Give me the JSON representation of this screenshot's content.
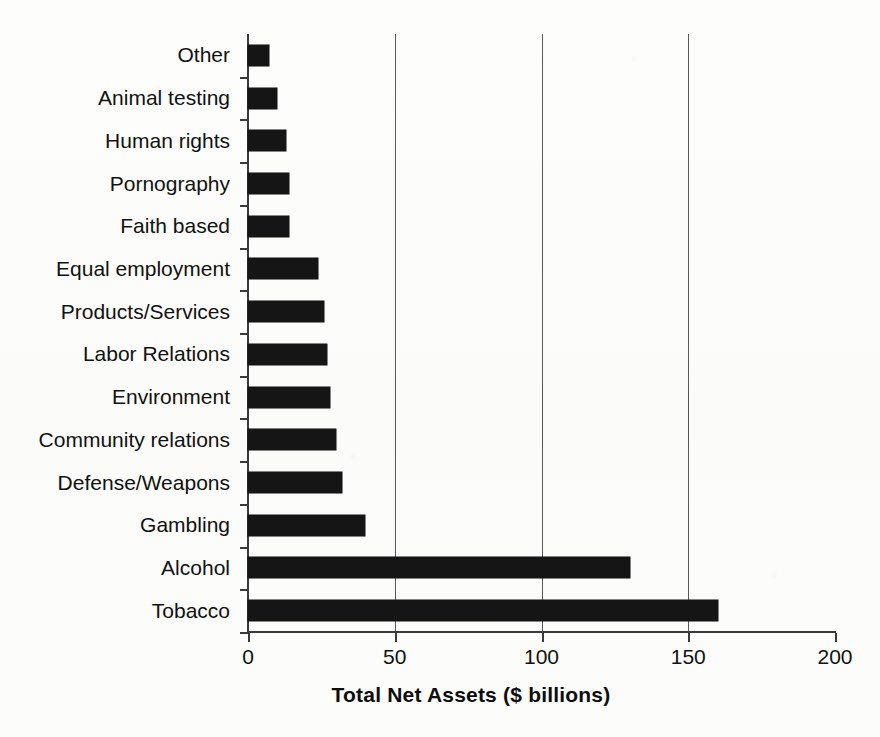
{
  "chart_data": {
    "type": "bar",
    "orientation": "horizontal",
    "title": "",
    "xlabel": "Total Net Assets ($ billions)",
    "ylabel": "",
    "xlim": [
      0,
      200
    ],
    "xticks": [
      0,
      50,
      100,
      150,
      200
    ],
    "xtick_labels": [
      "0",
      "50",
      "100",
      "150",
      "200"
    ],
    "grid": "vertical",
    "legend": "none",
    "categories": [
      "Other",
      "Animal testing",
      "Human rights",
      "Pornography",
      "Faith based",
      "Equal employment",
      "Products/Services",
      "Labor Relations",
      "Environment",
      "Community relations",
      "Defense/Weapons",
      "Gambling",
      "Alcohol",
      "Tobacco"
    ],
    "values": [
      7,
      10,
      13,
      14,
      14,
      24,
      26,
      27,
      28,
      30,
      32,
      40,
      130,
      160
    ],
    "series": [
      {
        "name": "Total Net Assets",
        "values": [
          7,
          10,
          13,
          14,
          14,
          24,
          26,
          27,
          28,
          30,
          32,
          40,
          130,
          160
        ]
      }
    ],
    "bar_color": "#151515",
    "axis_color": "#3a3a3c",
    "grid_color": "#58585a",
    "background_color": "#fdfdfc"
  }
}
